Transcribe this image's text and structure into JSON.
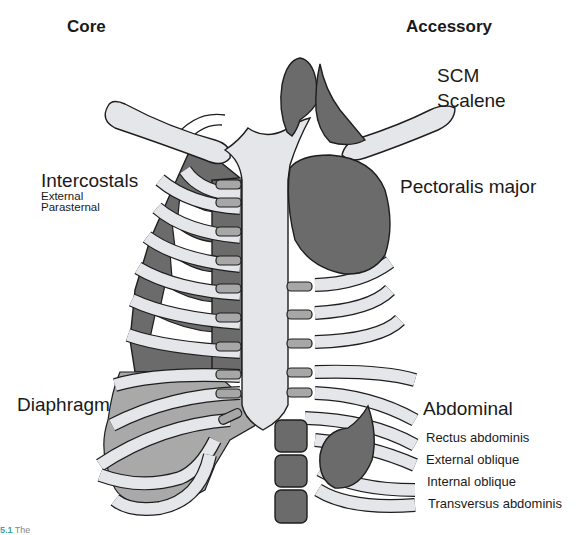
{
  "headings": {
    "core": "Core",
    "accessory": "Accessory"
  },
  "core_labels": {
    "intercostals": {
      "title": "Intercostals",
      "items": [
        "External",
        "Parasternal"
      ]
    },
    "diaphragm": {
      "title": "Diaphragm"
    }
  },
  "accessory_labels": {
    "scm": "SCM",
    "scalene": "Scalene",
    "pectoralis": "Pectoralis major",
    "abdominal": {
      "title": "Abdominal",
      "items": [
        "Rectus abdominis",
        "External oblique",
        "Internal oblique",
        "Transversus abdominis"
      ]
    }
  },
  "caption": {
    "number": "5.1",
    "text": "The"
  },
  "colors": {
    "bone": "#e4e6ea",
    "muscle_dark": "#6b6b6b",
    "muscle_light": "#a9a9a9",
    "cartilage": "#a7a7a7",
    "caption_accent": "#3aa3a8"
  }
}
